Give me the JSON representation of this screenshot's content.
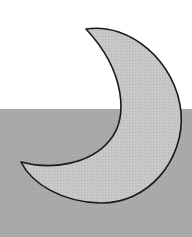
{
  "scene": {
    "description": "Crescent moon over a gray horizon band",
    "colors": {
      "sky": "#ffffff",
      "ground": "#a8a8a8",
      "moon_fill": "#c4c4c4",
      "moon_outline": "#1a1a1a"
    },
    "moon": {
      "icon": "crescent-moon-icon",
      "upper_tip": [
        86,
        29
      ],
      "lower_tip": [
        21,
        162
      ],
      "rightmost": [
        181,
        115
      ],
      "bottom": [
        100,
        203
      ]
    },
    "horizon_y": 109
  }
}
